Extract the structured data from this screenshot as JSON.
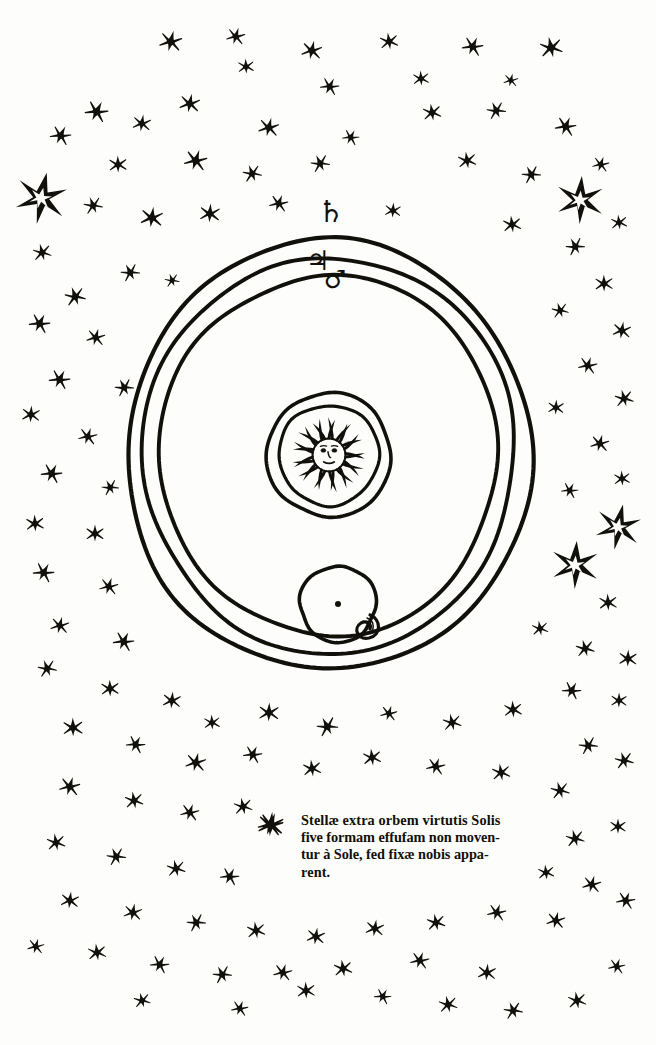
{
  "plate": {
    "title": "Heliocentric cosmological diagram with fixed-star field",
    "ink_color": "#12100a",
    "paper_color": "#fdfdfb"
  },
  "orbits": [
    {
      "id": "saturn",
      "symbol": "♄",
      "symbol_name": "saturn-symbol",
      "label": "Saturn",
      "rx": 202,
      "ry": 215
    },
    {
      "id": "jupiter",
      "symbol": "♃",
      "symbol_name": "jupiter-symbol",
      "label": "Jupiter",
      "rx": 186,
      "ry": 198
    },
    {
      "id": "mars",
      "symbol": "♂",
      "symbol_name": "mars-symbol",
      "label": "Mars",
      "rx": 169,
      "ry": 180
    }
  ],
  "sun": {
    "label": "Sol",
    "outer_circle_r": 62,
    "inner_circle_r": 50,
    "ray_count": 26,
    "face": "sun-with-face"
  },
  "earth": {
    "label": "Earth orbit with Moon",
    "orbit_r": 38,
    "center_dot": true,
    "moon_phase": "crescent"
  },
  "caption": {
    "lead_glyph": "✻",
    "lines": [
      "Stellæ extra orbem virtutis Solis",
      "five formam effufam non moven-",
      "tur à Sole, fed fixæ nobis appa-",
      "rent."
    ],
    "full_text": "Stellæ extra orbem virtutis Solis five formam effufam non moventur à Sole, fed fixæ nobis apparent."
  },
  "star_field": {
    "description": "Annular field of fixed stars surrounding the orbits",
    "small_star_points": 6,
    "large_star_points": 6,
    "large_stars": [
      {
        "x": 41,
        "y": 198,
        "r": 26
      },
      {
        "x": 580,
        "y": 200,
        "r": 24
      },
      {
        "x": 618,
        "y": 527,
        "r": 23
      },
      {
        "x": 575,
        "y": 565,
        "r": 24
      }
    ],
    "small_stars": [
      {
        "x": 171,
        "y": 41,
        "r": 11
      },
      {
        "x": 236,
        "y": 36,
        "r": 9
      },
      {
        "x": 312,
        "y": 50,
        "r": 10
      },
      {
        "x": 246,
        "y": 66,
        "r": 8
      },
      {
        "x": 389,
        "y": 41,
        "r": 9
      },
      {
        "x": 473,
        "y": 46,
        "r": 10
      },
      {
        "x": 551,
        "y": 47,
        "r": 11
      },
      {
        "x": 330,
        "y": 86,
        "r": 9
      },
      {
        "x": 421,
        "y": 78,
        "r": 8
      },
      {
        "x": 511,
        "y": 80,
        "r": 7
      },
      {
        "x": 97,
        "y": 111,
        "r": 11
      },
      {
        "x": 142,
        "y": 123,
        "r": 9
      },
      {
        "x": 190,
        "y": 103,
        "r": 10
      },
      {
        "x": 269,
        "y": 127,
        "r": 10
      },
      {
        "x": 351,
        "y": 137,
        "r": 8
      },
      {
        "x": 432,
        "y": 112,
        "r": 9
      },
      {
        "x": 496,
        "y": 110,
        "r": 9
      },
      {
        "x": 566,
        "y": 126,
        "r": 10
      },
      {
        "x": 61,
        "y": 135,
        "r": 10
      },
      {
        "x": 118,
        "y": 164,
        "r": 9
      },
      {
        "x": 196,
        "y": 160,
        "r": 11
      },
      {
        "x": 252,
        "y": 173,
        "r": 9
      },
      {
        "x": 320,
        "y": 163,
        "r": 9
      },
      {
        "x": 467,
        "y": 160,
        "r": 9
      },
      {
        "x": 531,
        "y": 174,
        "r": 9
      },
      {
        "x": 601,
        "y": 164,
        "r": 8
      },
      {
        "x": 93,
        "y": 205,
        "r": 9
      },
      {
        "x": 152,
        "y": 217,
        "r": 11
      },
      {
        "x": 210,
        "y": 213,
        "r": 10
      },
      {
        "x": 279,
        "y": 203,
        "r": 9
      },
      {
        "x": 393,
        "y": 210,
        "r": 8
      },
      {
        "x": 512,
        "y": 224,
        "r": 9
      },
      {
        "x": 575,
        "y": 246,
        "r": 9
      },
      {
        "x": 619,
        "y": 222,
        "r": 8
      },
      {
        "x": 42,
        "y": 252,
        "r": 9
      },
      {
        "x": 75,
        "y": 296,
        "r": 10
      },
      {
        "x": 130,
        "y": 272,
        "r": 9
      },
      {
        "x": 172,
        "y": 280,
        "r": 7
      },
      {
        "x": 604,
        "y": 283,
        "r": 9
      },
      {
        "x": 560,
        "y": 310,
        "r": 8
      },
      {
        "x": 622,
        "y": 330,
        "r": 9
      },
      {
        "x": 40,
        "y": 323,
        "r": 10
      },
      {
        "x": 96,
        "y": 337,
        "r": 9
      },
      {
        "x": 60,
        "y": 379,
        "r": 10
      },
      {
        "x": 124,
        "y": 387,
        "r": 9
      },
      {
        "x": 588,
        "y": 365,
        "r": 9
      },
      {
        "x": 624,
        "y": 398,
        "r": 9
      },
      {
        "x": 556,
        "y": 407,
        "r": 8
      },
      {
        "x": 31,
        "y": 414,
        "r": 9
      },
      {
        "x": 88,
        "y": 436,
        "r": 9
      },
      {
        "x": 600,
        "y": 443,
        "r": 9
      },
      {
        "x": 52,
        "y": 473,
        "r": 10
      },
      {
        "x": 110,
        "y": 487,
        "r": 8
      },
      {
        "x": 622,
        "y": 478,
        "r": 8
      },
      {
        "x": 570,
        "y": 490,
        "r": 8
      },
      {
        "x": 35,
        "y": 523,
        "r": 9
      },
      {
        "x": 95,
        "y": 533,
        "r": 9
      },
      {
        "x": 608,
        "y": 602,
        "r": 9
      },
      {
        "x": 44,
        "y": 572,
        "r": 10
      },
      {
        "x": 109,
        "y": 586,
        "r": 9
      },
      {
        "x": 540,
        "y": 628,
        "r": 8
      },
      {
        "x": 585,
        "y": 648,
        "r": 9
      },
      {
        "x": 628,
        "y": 658,
        "r": 9
      },
      {
        "x": 60,
        "y": 625,
        "r": 9
      },
      {
        "x": 124,
        "y": 641,
        "r": 10
      },
      {
        "x": 572,
        "y": 690,
        "r": 9
      },
      {
        "x": 619,
        "y": 700,
        "r": 8
      },
      {
        "x": 47,
        "y": 668,
        "r": 9
      },
      {
        "x": 110,
        "y": 688,
        "r": 9
      },
      {
        "x": 172,
        "y": 700,
        "r": 9
      },
      {
        "x": 212,
        "y": 722,
        "r": 8
      },
      {
        "x": 269,
        "y": 712,
        "r": 10
      },
      {
        "x": 327,
        "y": 726,
        "r": 10
      },
      {
        "x": 389,
        "y": 713,
        "r": 8
      },
      {
        "x": 452,
        "y": 722,
        "r": 9
      },
      {
        "x": 513,
        "y": 709,
        "r": 9
      },
      {
        "x": 588,
        "y": 745,
        "r": 9
      },
      {
        "x": 624,
        "y": 760,
        "r": 9
      },
      {
        "x": 73,
        "y": 727,
        "r": 10
      },
      {
        "x": 136,
        "y": 744,
        "r": 9
      },
      {
        "x": 196,
        "y": 762,
        "r": 10
      },
      {
        "x": 253,
        "y": 754,
        "r": 9
      },
      {
        "x": 312,
        "y": 768,
        "r": 9
      },
      {
        "x": 372,
        "y": 757,
        "r": 9
      },
      {
        "x": 436,
        "y": 766,
        "r": 9
      },
      {
        "x": 501,
        "y": 772,
        "r": 9
      },
      {
        "x": 560,
        "y": 790,
        "r": 9
      },
      {
        "x": 70,
        "y": 786,
        "r": 10
      },
      {
        "x": 134,
        "y": 800,
        "r": 9
      },
      {
        "x": 190,
        "y": 812,
        "r": 9
      },
      {
        "x": 243,
        "y": 806,
        "r": 9
      },
      {
        "x": 271,
        "y": 824,
        "r": 12
      },
      {
        "x": 575,
        "y": 838,
        "r": 9
      },
      {
        "x": 618,
        "y": 826,
        "r": 8
      },
      {
        "x": 56,
        "y": 842,
        "r": 9
      },
      {
        "x": 116,
        "y": 856,
        "r": 9
      },
      {
        "x": 176,
        "y": 868,
        "r": 9
      },
      {
        "x": 230,
        "y": 876,
        "r": 9
      },
      {
        "x": 592,
        "y": 884,
        "r": 9
      },
      {
        "x": 546,
        "y": 872,
        "r": 8
      },
      {
        "x": 626,
        "y": 900,
        "r": 9
      },
      {
        "x": 70,
        "y": 900,
        "r": 9
      },
      {
        "x": 133,
        "y": 912,
        "r": 9
      },
      {
        "x": 196,
        "y": 922,
        "r": 9
      },
      {
        "x": 256,
        "y": 930,
        "r": 9
      },
      {
        "x": 316,
        "y": 936,
        "r": 9
      },
      {
        "x": 375,
        "y": 928,
        "r": 9
      },
      {
        "x": 436,
        "y": 922,
        "r": 9
      },
      {
        "x": 497,
        "y": 912,
        "r": 9
      },
      {
        "x": 556,
        "y": 920,
        "r": 9
      },
      {
        "x": 97,
        "y": 952,
        "r": 9
      },
      {
        "x": 160,
        "y": 964,
        "r": 9
      },
      {
        "x": 222,
        "y": 974,
        "r": 9
      },
      {
        "x": 283,
        "y": 972,
        "r": 9
      },
      {
        "x": 306,
        "y": 990,
        "r": 9
      },
      {
        "x": 343,
        "y": 968,
        "r": 9
      },
      {
        "x": 420,
        "y": 960,
        "r": 9
      },
      {
        "x": 487,
        "y": 972,
        "r": 9
      },
      {
        "x": 448,
        "y": 1004,
        "r": 9
      },
      {
        "x": 513,
        "y": 1010,
        "r": 9
      },
      {
        "x": 577,
        "y": 1000,
        "r": 9
      },
      {
        "x": 617,
        "y": 966,
        "r": 8
      },
      {
        "x": 36,
        "y": 946,
        "r": 8
      },
      {
        "x": 240,
        "y": 1008,
        "r": 8
      },
      {
        "x": 383,
        "y": 996,
        "r": 8
      },
      {
        "x": 142,
        "y": 1000,
        "r": 8
      }
    ]
  }
}
